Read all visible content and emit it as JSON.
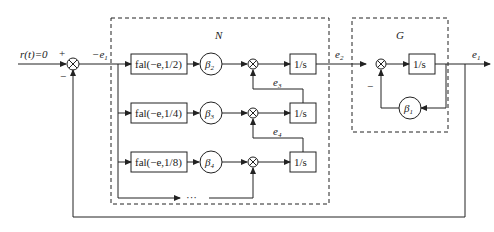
{
  "input_label": "r(t)=0",
  "plus_sign": "+",
  "minus_sign": "−",
  "signals": {
    "neg_e1": "−e",
    "neg_e1_sub": "1",
    "e2": "e",
    "e2_sub": "2",
    "e3": "e",
    "e3_sub": "3",
    "e4": "e",
    "e4_sub": "4",
    "e1": "e",
    "e1_sub": "1"
  },
  "blocks": {
    "N": {
      "label": "N",
      "rows": [
        {
          "fal": "fal(−e,1/2)",
          "beta": "β",
          "beta_sub": "2",
          "integrator": "1/s"
        },
        {
          "fal": "fal(−e,1/4)",
          "beta": "β",
          "beta_sub": "3",
          "integrator": "1/s"
        },
        {
          "fal": "fal(−e,1/8)",
          "beta": "β",
          "beta_sub": "4",
          "integrator": "1/s"
        }
      ],
      "ellipsis": "···"
    },
    "G": {
      "label": "G",
      "integrator": "1/s",
      "beta": "β",
      "beta_sub": "1",
      "minus": "−"
    }
  },
  "colors": {
    "line": "#222222",
    "background": "#ffffff"
  }
}
